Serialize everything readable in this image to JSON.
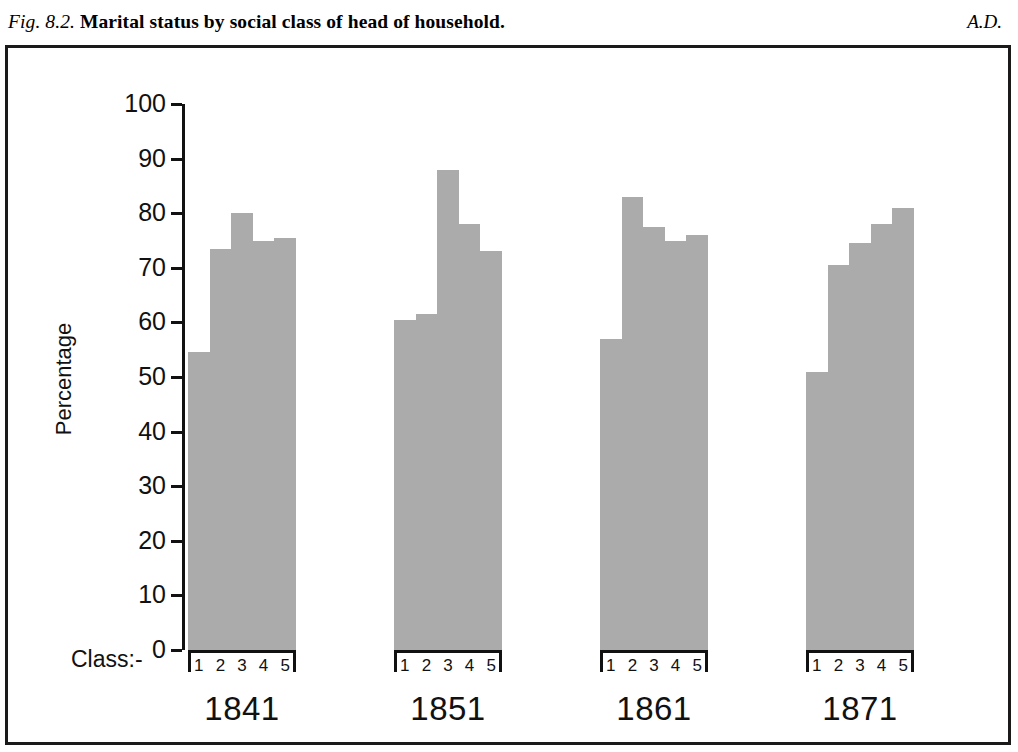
{
  "caption": {
    "figure_number": "Fig. 8.2.",
    "title": "Marital status by social class of head of household.",
    "right_note": "A.D."
  },
  "chart_data": {
    "type": "bar",
    "title": "Marital status by social class of head of household.",
    "xlabel": "Class:-",
    "ylabel": "Percentage",
    "ylim": [
      0,
      100
    ],
    "ytick_labels": [
      "100",
      "90",
      "80",
      "70",
      "60",
      "50",
      "40",
      "30",
      "20",
      "10",
      "0"
    ],
    "ytick_values": [
      100,
      90,
      80,
      70,
      60,
      50,
      40,
      30,
      20,
      10,
      0
    ],
    "grid": false,
    "legend": "none",
    "bar_color": "#ababab",
    "axis_color": "#111111",
    "categories": [
      "1",
      "2",
      "3",
      "4",
      "5"
    ],
    "groups": [
      {
        "year": "1841",
        "categories": [
          "1",
          "2",
          "3",
          "4",
          "5"
        ],
        "values": [
          54.5,
          73.5,
          80,
          75,
          75.5
        ]
      },
      {
        "year": "1851",
        "categories": [
          "1",
          "2",
          "3",
          "4",
          "5"
        ],
        "values": [
          60.5,
          61.5,
          88,
          78,
          73
        ]
      },
      {
        "year": "1861",
        "categories": [
          "1",
          "2",
          "3",
          "4",
          "5"
        ],
        "values": [
          57,
          83,
          77.5,
          75,
          76
        ]
      },
      {
        "year": "1871",
        "categories": [
          "1",
          "2",
          "3",
          "4",
          "5"
        ],
        "values": [
          51,
          70.5,
          74.5,
          78,
          81
        ]
      }
    ]
  }
}
